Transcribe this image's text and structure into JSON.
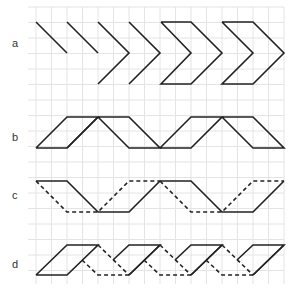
{
  "figure": {
    "width": 297,
    "height": 289,
    "colors": {
      "grid": "#e4e4e4",
      "stroke": "#222222",
      "label": "#333333"
    },
    "grid": {
      "x0": 36,
      "y0": 7,
      "x1": 284,
      "y1": 284,
      "step": 15.5
    },
    "rows": [
      {
        "id": "a",
        "label": "a",
        "label_x": 12,
        "label_y": 47
      },
      {
        "id": "b",
        "label": "b",
        "label_x": 12,
        "label_y": 141
      },
      {
        "id": "c",
        "label": "c",
        "label_x": 12,
        "label_y": 199
      },
      {
        "id": "d",
        "label": "d",
        "label_x": 12,
        "label_y": 268
      }
    ]
  },
  "shapes": {
    "a": {
      "solid": [
        [
          [
            36,
            22
          ],
          [
            67,
            53
          ]
        ],
        [
          [
            67,
            22
          ],
          [
            98,
            53
          ]
        ],
        [
          [
            98,
            22
          ],
          [
            129,
            53
          ],
          [
            98,
            84
          ]
        ],
        [
          [
            129,
            22
          ],
          [
            160,
            53
          ],
          [
            129,
            84
          ]
        ],
        [
          [
            161,
            22
          ],
          [
            191,
            53
          ],
          [
            161,
            84
          ],
          [
            191,
            84
          ],
          [
            222,
            53
          ],
          [
            191,
            22
          ],
          [
            161,
            22
          ]
        ],
        [
          [
            222,
            22
          ],
          [
            253,
            53
          ],
          [
            222,
            84
          ],
          [
            253,
            84
          ],
          [
            284,
            53
          ],
          [
            253,
            22
          ],
          [
            222,
            22
          ]
        ]
      ],
      "dashed": []
    },
    "b": {
      "solid": [
        [
          [
            36,
            148
          ],
          [
            67,
            148
          ],
          [
            98,
            117
          ],
          [
            67,
            117
          ],
          [
            36,
            148
          ]
        ],
        [
          [
            67,
            148
          ],
          [
            98,
            117
          ]
        ],
        [
          [
            98,
            117
          ],
          [
            129,
            117
          ],
          [
            160,
            148
          ],
          [
            129,
            148
          ],
          [
            98,
            117
          ]
        ],
        [
          [
            160,
            148
          ],
          [
            191,
            148
          ],
          [
            222,
            117
          ],
          [
            191,
            117
          ],
          [
            160,
            148
          ]
        ],
        [
          [
            222,
            117
          ],
          [
            253,
            117
          ],
          [
            284,
            148
          ],
          [
            253,
            148
          ],
          [
            222,
            117
          ]
        ]
      ],
      "dashed": []
    },
    "c": {
      "solid": [
        [
          [
            36,
            181
          ],
          [
            67,
            181
          ],
          [
            98,
            212
          ],
          [
            129,
            212
          ],
          [
            160,
            181
          ]
        ],
        [
          [
            160,
            181
          ],
          [
            191,
            181
          ],
          [
            222,
            212
          ],
          [
            253,
            212
          ],
          [
            284,
            181
          ]
        ]
      ],
      "dashed": [
        [
          [
            36,
            181
          ],
          [
            67,
            212
          ],
          [
            98,
            212
          ],
          [
            129,
            181
          ],
          [
            160,
            181
          ]
        ],
        [
          [
            160,
            181
          ],
          [
            191,
            212
          ],
          [
            222,
            212
          ],
          [
            253,
            181
          ],
          [
            284,
            181
          ]
        ]
      ]
    },
    "d": {
      "solid": [
        [
          [
            36,
            275
          ],
          [
            67,
            275
          ],
          [
            98,
            245
          ],
          [
            67,
            245
          ],
          [
            36,
            275
          ]
        ],
        [
          [
            113,
            260
          ],
          [
            129,
            245
          ],
          [
            160,
            245
          ],
          [
            129,
            275
          ]
        ],
        [
          [
            129,
            275
          ],
          [
            160,
            245
          ]
        ],
        [
          [
            175,
            260
          ],
          [
            191,
            245
          ],
          [
            222,
            245
          ],
          [
            191,
            275
          ]
        ],
        [
          [
            191,
            275
          ],
          [
            222,
            245
          ]
        ],
        [
          [
            237,
            260
          ],
          [
            253,
            245
          ],
          [
            284,
            245
          ],
          [
            253,
            275
          ]
        ],
        [
          [
            253,
            275
          ],
          [
            284,
            245
          ]
        ]
      ],
      "dashed": [
        [
          [
            98,
            245
          ],
          [
            129,
            275
          ]
        ],
        [
          [
            82,
            260
          ],
          [
            98,
            275
          ],
          [
            129,
            275
          ]
        ],
        [
          [
            160,
            245
          ],
          [
            191,
            275
          ]
        ],
        [
          [
            144,
            260
          ],
          [
            160,
            275
          ],
          [
            191,
            275
          ]
        ],
        [
          [
            222,
            245
          ],
          [
            253,
            275
          ]
        ],
        [
          [
            206,
            260
          ],
          [
            222,
            275
          ],
          [
            253,
            275
          ]
        ]
      ]
    }
  }
}
